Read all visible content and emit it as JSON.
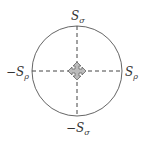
{
  "diagram": {
    "labels": {
      "top": {
        "main": "S",
        "sub": "σ"
      },
      "bottom": {
        "main": "−S",
        "sub": "σ"
      },
      "left": {
        "main": "−S",
        "sub": "ρ"
      },
      "right": {
        "main": "S",
        "sub": "ρ"
      }
    },
    "center_icon": "four-way-arrow-icon",
    "colors": {
      "stroke": "#555555",
      "icon_fill": "#bbbbbb"
    }
  }
}
